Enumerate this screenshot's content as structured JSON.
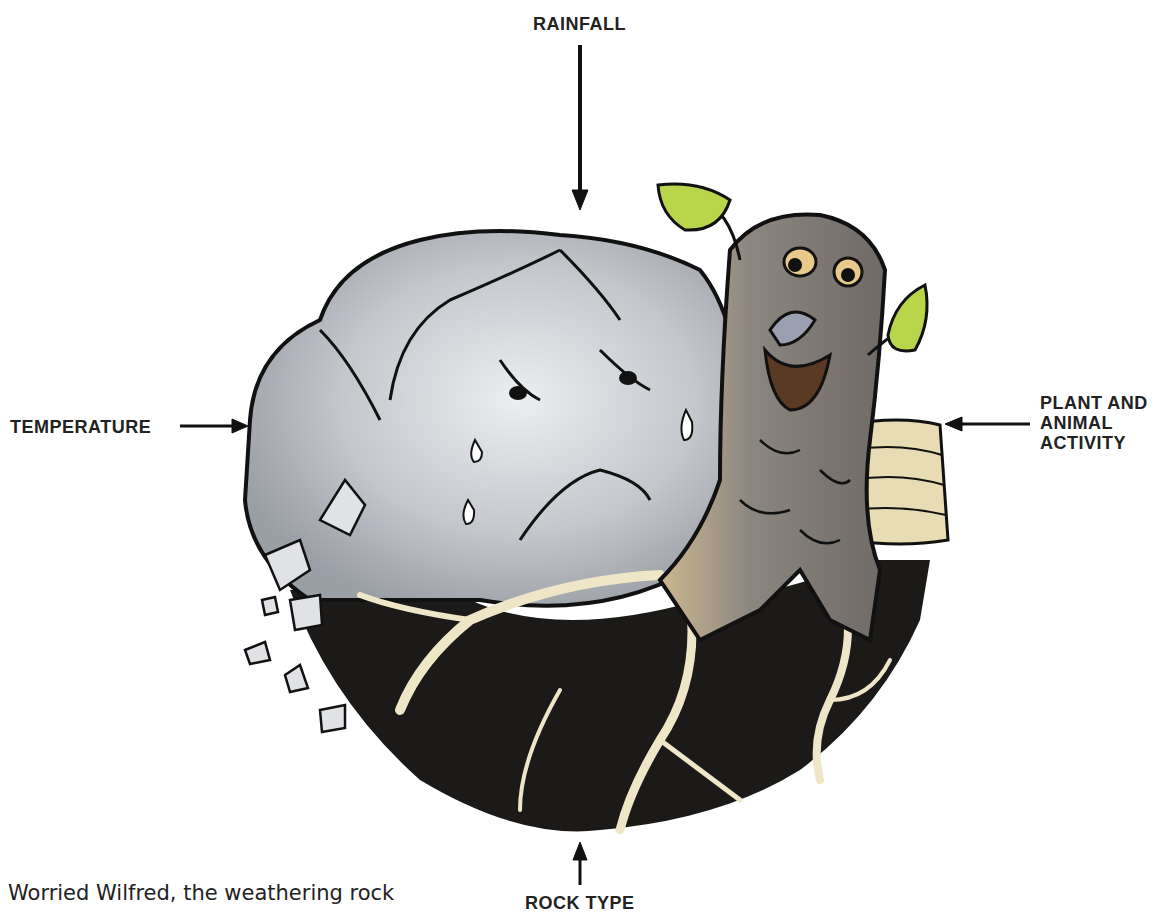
{
  "labels": {
    "top": "RAINFALL",
    "left": "TEMPERATURE",
    "right_lines": [
      "PLANT AND",
      "ANIMAL",
      "ACTIVITY"
    ],
    "bottom": "ROCK TYPE"
  },
  "caption": "Worried Wilfred, the weathering rock",
  "characters": {
    "rock": "worried crying rock",
    "stump": "smiling tree stump with leaves"
  },
  "colors": {
    "rock": "#b9bcc2",
    "rock_light": "#e4e6ea",
    "soil": "#1c1a18",
    "root": "#efe6c8",
    "stump": "#8a8580",
    "leaf": "#b9d64a",
    "strata": "#e8dcb4",
    "ink": "#111111"
  }
}
